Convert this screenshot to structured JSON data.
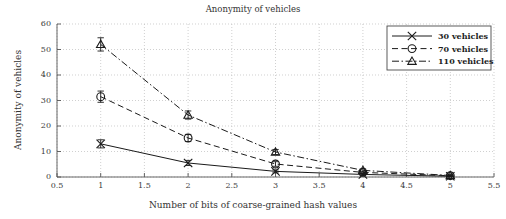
{
  "chart_data": {
    "type": "line",
    "title": "Anonymity of vehicles",
    "xlabel": "Number of bits of coarse-grained hash values",
    "ylabel": "Anonymity of vehicles",
    "xlim": [
      0.5,
      5.5
    ],
    "ylim": [
      0,
      60
    ],
    "xticks": [
      "0.5",
      "1",
      "1.5",
      "2",
      "2.5",
      "3",
      "3.5",
      "4",
      "4.5",
      "5",
      "5.5"
    ],
    "xtick_values": [
      0.5,
      1,
      1.5,
      2,
      2.5,
      3,
      3.5,
      4,
      4.5,
      5,
      5.5
    ],
    "yticks": [
      "0",
      "10",
      "20",
      "30",
      "40",
      "50",
      "60"
    ],
    "ytick_values": [
      0,
      10,
      20,
      30,
      40,
      50,
      60
    ],
    "grid": true,
    "grid_style": "dotted",
    "legend_position": "top-right",
    "x": [
      1,
      2,
      3,
      4,
      5
    ],
    "series": [
      {
        "name": "30 vehicles",
        "label": "30 vehicles",
        "marker": "x",
        "line_style": "solid",
        "color": "#1a1a1a",
        "values": [
          13.0,
          5.5,
          2.2,
          1.0,
          0.3
        ],
        "errors": [
          1.6,
          1.0,
          0.6,
          0.4,
          0.2
        ]
      },
      {
        "name": "70 vehicles",
        "label": "70 vehicles",
        "marker": "circle",
        "line_style": "dashed",
        "color": "#1a1a1a",
        "values": [
          31.5,
          15.3,
          5.1,
          1.8,
          0.5
        ],
        "errors": [
          2.2,
          1.4,
          0.9,
          0.5,
          0.2
        ]
      },
      {
        "name": "110 vehicles",
        "label": "110 vehicles",
        "marker": "triangle",
        "line_style": "dash-dot",
        "color": "#1a1a1a",
        "values": [
          52.0,
          24.3,
          9.8,
          2.6,
          0.6
        ],
        "errors": [
          2.6,
          1.6,
          1.0,
          0.6,
          0.3
        ]
      }
    ]
  },
  "legend": {
    "entries": [
      {
        "label": "30 vehicles"
      },
      {
        "label": "70 vehicles"
      },
      {
        "label": "110 vehicles"
      }
    ]
  },
  "axes": {
    "x_ticks": [
      "0.5",
      "1",
      "1.5",
      "2",
      "2.5",
      "3",
      "3.5",
      "4",
      "4.5",
      "5",
      "5.5"
    ],
    "y_ticks": [
      "0",
      "10",
      "20",
      "30",
      "40",
      "50",
      "60"
    ]
  },
  "colors": {
    "line": "#1a1a1a",
    "grid": "#bcbcbc",
    "axis": "#555555",
    "text": "#333333",
    "background": "#ffffff"
  }
}
